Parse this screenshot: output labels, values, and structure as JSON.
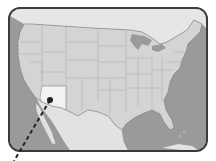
{
  "map": {
    "title": "United States",
    "highlighted_region": "Arizona",
    "colors": {
      "ocean": "#9a9a9a",
      "land": "#d4d4d4",
      "state_border": "#b0b0b0",
      "highlight": "#f2f2f2",
      "mexico": "#e2e2e2",
      "canada": "#e6e6e6",
      "frame_border": "#3a3a3a",
      "marker": "#222222"
    },
    "marker": {
      "label": "",
      "x": 50,
      "y": 100
    },
    "leader_line": {
      "style": "dashed",
      "from": [
        50,
        100
      ],
      "to": [
        14,
        161
      ]
    }
  }
}
